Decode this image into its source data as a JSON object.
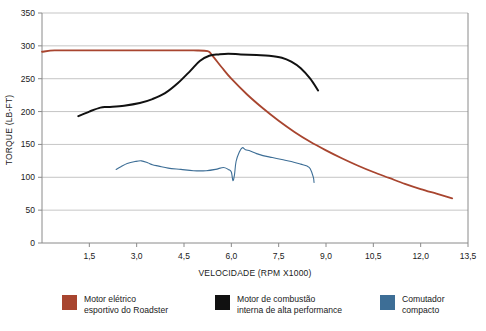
{
  "chart_data": {
    "type": "line",
    "title": "",
    "xlabel": "VELOCIDADE (RPM X1000)",
    "ylabel": "TORQUE (LB-FT)",
    "xlim": [
      0,
      13.5
    ],
    "ylim": [
      0,
      350
    ],
    "xticks": [
      "1,5",
      "3,0",
      "4,5",
      "6,0",
      "7,5",
      "9,0",
      "10,5",
      "12,0",
      "13,5"
    ],
    "xtick_values": [
      1.5,
      3.0,
      4.5,
      6.0,
      7.5,
      9.0,
      10.5,
      12.0,
      13.5
    ],
    "yticks": [
      "0",
      "50",
      "100",
      "150",
      "200",
      "250",
      "300",
      "350"
    ],
    "ytick_values": [
      0,
      50,
      100,
      150,
      200,
      250,
      300,
      350
    ],
    "grid": "horizontal",
    "legend_position": "bottom",
    "series": [
      {
        "name": "Motor elétrico esportivo do Roadster",
        "color": "#a8452f",
        "x": [
          0.0,
          0.4,
          1.0,
          2.0,
          3.0,
          4.0,
          4.8,
          5.25,
          5.4,
          5.7,
          6.0,
          6.5,
          7.0,
          7.5,
          8.0,
          8.5,
          9.0,
          9.5,
          10.0,
          10.5,
          11.0,
          11.5,
          12.0,
          12.5,
          13.0
        ],
        "y": [
          291,
          293,
          293,
          293,
          293,
          293,
          293,
          292,
          285,
          267,
          250,
          226,
          205,
          186,
          169,
          154,
          141,
          129,
          118,
          108,
          99,
          90,
          82,
          75,
          68
        ]
      },
      {
        "name": "Motor de combustão interna de alta performance",
        "color": "#111111",
        "x": [
          1.15,
          1.5,
          1.85,
          2.1,
          2.6,
          3.1,
          3.5,
          3.9,
          4.3,
          4.7,
          5.0,
          5.3,
          5.6,
          5.9,
          6.3,
          6.8,
          7.2,
          7.6,
          7.9,
          8.2,
          8.5,
          8.75
        ],
        "y": [
          193,
          200,
          206,
          207,
          209,
          213,
          219,
          228,
          243,
          262,
          277,
          285,
          287,
          288,
          287,
          286,
          285,
          282,
          276,
          266,
          250,
          232
        ]
      },
      {
        "name": "Comutador compacto",
        "color": "#3d6e96",
        "x": [
          2.35,
          2.5,
          2.7,
          2.95,
          3.15,
          3.35,
          3.5,
          3.7,
          4.0,
          4.4,
          4.8,
          5.2,
          5.5,
          5.75,
          5.9,
          6.0,
          6.05,
          6.1,
          6.15,
          6.25,
          6.35,
          6.45,
          6.6,
          6.8,
          7.0,
          7.3,
          7.6,
          7.9,
          8.2,
          8.4,
          8.5,
          8.6,
          8.62
        ],
        "y": [
          112,
          116,
          121,
          124,
          125,
          122,
          119,
          117,
          114,
          112,
          110,
          110,
          112,
          115,
          112,
          108,
          95,
          104,
          124,
          138,
          145,
          142,
          140,
          136,
          133,
          130,
          127,
          124,
          120,
          117,
          113,
          100,
          92
        ]
      }
    ]
  },
  "legend": {
    "items": [
      {
        "label": "Motor elétrico\nesportivo do Roadster",
        "color": "#a8452f"
      },
      {
        "label": "Motor de combustão\ninterna de alta performance",
        "color": "#111111"
      },
      {
        "label": "Comutador\ncompacto",
        "color": "#3d6e96"
      }
    ]
  }
}
